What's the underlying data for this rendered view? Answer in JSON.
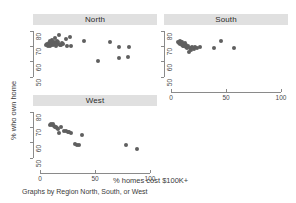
{
  "chart_data": {
    "type": "scatter",
    "title": "",
    "xlabel": "% homes cost $100K+",
    "ylabel": "% who own home",
    "note": "Graphs by Region North, South, or West",
    "xlim": [
      0,
      100
    ],
    "ylim": [
      45,
      82
    ],
    "xticks": [
      0,
      50,
      100
    ],
    "xtick_labels": [
      "0",
      "50",
      "100"
    ],
    "yticks": [
      50,
      60,
      70,
      80
    ],
    "ytick_labels": [
      "50",
      "60",
      "70",
      "80"
    ],
    "grid": false,
    "legend": "none",
    "marker_color": "#5f5f5f",
    "panel_header_color": "#e0e0e0",
    "panels": [
      {
        "name": "North",
        "points": [
          {
            "x": 5.5,
            "y": 70.8
          },
          {
            "x": 6.5,
            "y": 71.6
          },
          {
            "x": 7.2,
            "y": 70.3
          },
          {
            "x": 7.8,
            "y": 72.0
          },
          {
            "x": 8.4,
            "y": 71.2
          },
          {
            "x": 8.9,
            "y": 73.4
          },
          {
            "x": 9.3,
            "y": 70.6
          },
          {
            "x": 9.8,
            "y": 72.6
          },
          {
            "x": 10.2,
            "y": 71.0
          },
          {
            "x": 10.8,
            "y": 74.1
          },
          {
            "x": 11.3,
            "y": 72.3
          },
          {
            "x": 11.9,
            "y": 70.9
          },
          {
            "x": 12.4,
            "y": 73.0
          },
          {
            "x": 13.0,
            "y": 71.5
          },
          {
            "x": 13.6,
            "y": 75.2
          },
          {
            "x": 14.1,
            "y": 72.1
          },
          {
            "x": 14.8,
            "y": 70.4
          },
          {
            "x": 15.4,
            "y": 73.8
          },
          {
            "x": 16.0,
            "y": 71.3
          },
          {
            "x": 16.8,
            "y": 72.8
          },
          {
            "x": 17.5,
            "y": 77.6
          },
          {
            "x": 18.2,
            "y": 71.1
          },
          {
            "x": 19.0,
            "y": 70.7
          },
          {
            "x": 19.8,
            "y": 72.4
          },
          {
            "x": 21.0,
            "y": 71.8
          },
          {
            "x": 23.5,
            "y": 75.0
          },
          {
            "x": 24.5,
            "y": 70.0
          },
          {
            "x": 27.5,
            "y": 76.2
          },
          {
            "x": 28.0,
            "y": 70.2
          },
          {
            "x": 40.0,
            "y": 73.5
          },
          {
            "x": 53.0,
            "y": 60.4
          },
          {
            "x": 64.0,
            "y": 73.0
          },
          {
            "x": 71.5,
            "y": 69.4
          },
          {
            "x": 72.0,
            "y": 62.4
          },
          {
            "x": 80.5,
            "y": 69.7
          },
          {
            "x": 80.0,
            "y": 63.1
          }
        ]
      },
      {
        "name": "South",
        "points": [
          {
            "x": 6.0,
            "y": 73.0
          },
          {
            "x": 7.0,
            "y": 72.2
          },
          {
            "x": 7.8,
            "y": 73.6
          },
          {
            "x": 8.4,
            "y": 71.8
          },
          {
            "x": 9.0,
            "y": 72.6
          },
          {
            "x": 9.6,
            "y": 71.0
          },
          {
            "x": 10.2,
            "y": 72.9
          },
          {
            "x": 10.8,
            "y": 70.4
          },
          {
            "x": 11.4,
            "y": 71.6
          },
          {
            "x": 12.0,
            "y": 70.0
          },
          {
            "x": 12.6,
            "y": 72.0
          },
          {
            "x": 13.2,
            "y": 69.6
          },
          {
            "x": 13.9,
            "y": 70.8
          },
          {
            "x": 14.6,
            "y": 68.7
          },
          {
            "x": 15.4,
            "y": 70.2
          },
          {
            "x": 16.2,
            "y": 66.4
          },
          {
            "x": 17.0,
            "y": 69.2
          },
          {
            "x": 18.0,
            "y": 67.8
          },
          {
            "x": 19.0,
            "y": 69.8
          },
          {
            "x": 20.5,
            "y": 68.4
          },
          {
            "x": 22.0,
            "y": 69.4
          },
          {
            "x": 24.0,
            "y": 69.1
          },
          {
            "x": 26.5,
            "y": 69.6
          },
          {
            "x": 39.5,
            "y": 68.9
          },
          {
            "x": 45.0,
            "y": 73.4
          },
          {
            "x": 57.5,
            "y": 68.8
          }
        ]
      },
      {
        "name": "West",
        "points": [
          {
            "x": 9.0,
            "y": 71.4
          },
          {
            "x": 10.0,
            "y": 72.0
          },
          {
            "x": 11.0,
            "y": 71.6
          },
          {
            "x": 11.8,
            "y": 72.3
          },
          {
            "x": 12.6,
            "y": 71.0
          },
          {
            "x": 13.4,
            "y": 70.6
          },
          {
            "x": 14.4,
            "y": 70.0
          },
          {
            "x": 15.3,
            "y": 69.6
          },
          {
            "x": 16.2,
            "y": 69.2
          },
          {
            "x": 17.5,
            "y": 66.2
          },
          {
            "x": 19.5,
            "y": 70.2
          },
          {
            "x": 22.0,
            "y": 67.6
          },
          {
            "x": 24.0,
            "y": 67.8
          },
          {
            "x": 25.5,
            "y": 67.2
          },
          {
            "x": 26.8,
            "y": 66.8
          },
          {
            "x": 28.0,
            "y": 66.4
          },
          {
            "x": 32.0,
            "y": 59.4
          },
          {
            "x": 33.5,
            "y": 58.8
          },
          {
            "x": 35.0,
            "y": 58.6
          },
          {
            "x": 38.5,
            "y": 65.4
          },
          {
            "x": 78.0,
            "y": 58.8
          },
          {
            "x": 88.5,
            "y": 56.0
          }
        ]
      }
    ]
  }
}
